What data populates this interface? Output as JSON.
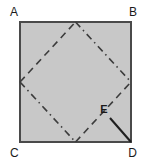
{
  "figure": {
    "canvas": {
      "width": 149,
      "height": 163,
      "background": "#ffffff"
    },
    "colors": {
      "square_fill": "#c8c8c8",
      "square_stroke": "#4a4a4a",
      "dash_stroke": "#3c3c3c",
      "dashdot_stroke": "#3c3c3c",
      "solid_stroke": "#1f1f1f",
      "label_color": "#1a1a1a"
    },
    "square": {
      "name": "ABCD",
      "x": 20,
      "y": 22,
      "width": 111,
      "height": 120,
      "stroke_width": 2
    },
    "labels": [
      {
        "id": "A",
        "text": "A",
        "x": 10,
        "y": 16,
        "corner": "top-left"
      },
      {
        "id": "B",
        "text": "B",
        "x": 134,
        "y": 16,
        "corner": "top-right"
      },
      {
        "id": "C",
        "text": "C",
        "x": 10,
        "y": 156,
        "corner": "bottom-left"
      },
      {
        "id": "D",
        "text": "D",
        "x": 134,
        "y": 156,
        "corner": "bottom-right"
      },
      {
        "id": "E",
        "text": "E",
        "x": 100,
        "y": 113,
        "corner": "interior"
      }
    ],
    "diamond": {
      "description": "Inscribed rhombus joining the midpoints of the square's sides",
      "vertices": {
        "top": {
          "x": 75.5,
          "y": 22
        },
        "right": {
          "x": 131,
          "y": 82
        },
        "bottom": {
          "x": 75.5,
          "y": 142
        },
        "left": {
          "x": 20,
          "y": 82
        }
      },
      "edges": [
        {
          "id": "left-to-top",
          "style": "dashed",
          "from": "left",
          "to": "top"
        },
        {
          "id": "top-to-right",
          "style": "dash-dot",
          "from": "top",
          "to": "right"
        },
        {
          "id": "left-to-bottom",
          "style": "dash-dot",
          "from": "left",
          "to": "bottom"
        },
        {
          "id": "bottom-to-right",
          "style": "dashed",
          "from": "bottom",
          "to": "right"
        }
      ],
      "dash_pattern": "7 5",
      "dashdot_pattern": "7 4 1.5 4",
      "stroke_width": 1.6
    },
    "point_e": {
      "id": "E",
      "x": 110,
      "y": 118,
      "lies_on": "bottom-to-right",
      "label_offset": {
        "dx": -10,
        "dy": -5
      }
    },
    "segment_ed": {
      "id": "ED",
      "style": "solid",
      "from": {
        "x": 110,
        "y": 118
      },
      "to": {
        "x": 131,
        "y": 142
      },
      "stroke_width": 2
    }
  }
}
